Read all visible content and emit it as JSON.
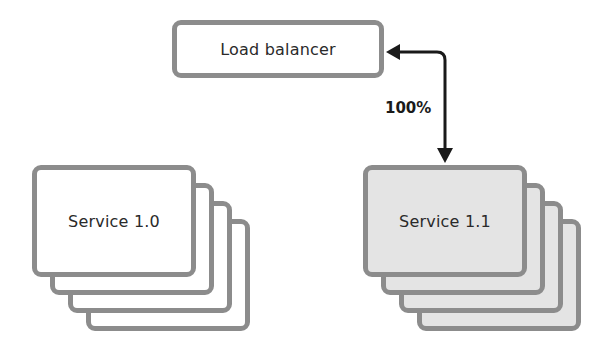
{
  "diagram": {
    "load_balancer": {
      "label": "Load balancer"
    },
    "traffic_label": "100%",
    "services": [
      {
        "label": "Service 1.0",
        "fill": "#ffffff",
        "instances": 4
      },
      {
        "label": "Service 1.1",
        "fill": "#e4e4e4",
        "instances": 4
      }
    ],
    "colors": {
      "border": "#8c8c8c",
      "arrow": "#1a1a1a"
    }
  }
}
